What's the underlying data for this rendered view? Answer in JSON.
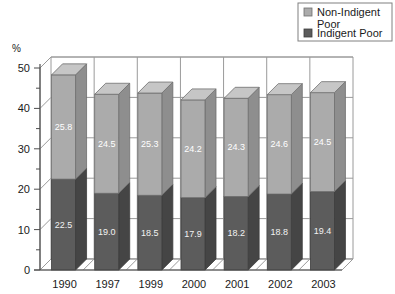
{
  "chart_data": {
    "type": "bar",
    "subtype": "stacked-3d-column",
    "title": "",
    "xlabel": "",
    "ylabel": "%",
    "ylim": [
      0,
      50
    ],
    "ytick_step": 10,
    "yminor_step": 5,
    "grid": true,
    "legend_position": "top-right",
    "categories": [
      "1990",
      "1997",
      "1999",
      "2000",
      "2001",
      "2002",
      "2003"
    ],
    "ytick_labels": [
      "0",
      "10",
      "20",
      "30",
      "40",
      "50"
    ],
    "series": [
      {
        "name": "Indigent Poor",
        "color": "#5c5c5c",
        "values": [
          22.5,
          19.0,
          18.5,
          17.9,
          18.2,
          18.8,
          19.4
        ],
        "labels": [
          "22.5",
          "19.0",
          "18.5",
          "17.9",
          "18.2",
          "18.8",
          "19.4"
        ]
      },
      {
        "name": "Non-Indigent Poor",
        "color": "#ababab",
        "values": [
          25.8,
          24.5,
          25.3,
          24.2,
          24.3,
          24.6,
          24.5
        ],
        "labels": [
          "25.8",
          "24.5",
          "25.3",
          "24.2",
          "24.3",
          "24.6",
          "24.5"
        ]
      }
    ],
    "totals": [
      48.3,
      43.5,
      43.8,
      42.1,
      42.5,
      43.4,
      43.9
    ]
  },
  "legend": {
    "items": [
      {
        "label_line1": "Non-Indigent",
        "label_line2": "Poor",
        "swatch_color": "#ababab"
      },
      {
        "label_line1": "Indigent Poor",
        "label_line2": "",
        "swatch_color": "#5c5c5c"
      }
    ]
  },
  "axis": {
    "unit_label": "%"
  },
  "colors": {
    "light_front": "#ababab",
    "light_top": "#c6c6c6",
    "light_side": "#8e8e8e",
    "dark_front": "#5c5c5c",
    "dark_top": "#7a7a7a",
    "dark_side": "#454545",
    "grid": "#9a9a9a",
    "axis": "#4d4d4d",
    "wall": "#ffffff"
  }
}
